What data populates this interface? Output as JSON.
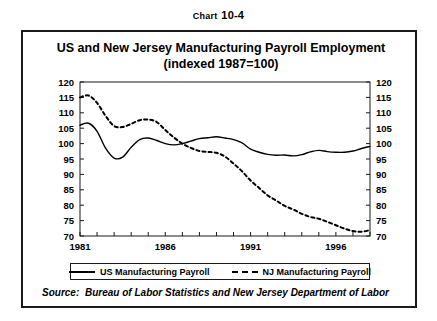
{
  "caption": {
    "prefix": "Chart",
    "number": "10-4",
    "full": "CHART 10-4"
  },
  "title": {
    "line1": "US and New Jersey Manufacturing Payroll Employment",
    "line2": "(indexed 1987=100)"
  },
  "source": {
    "label": "Source:",
    "text": "Bureau of Labor Statistics and New Jersey Department of Labor"
  },
  "legend": {
    "items": [
      {
        "label": "US Manufacturing Payroll",
        "style": "solid"
      },
      {
        "label": "NJ Manufacturing Payroll",
        "style": "dashed"
      }
    ]
  },
  "axis": {
    "y_ticks": [
      "120",
      "115",
      "110",
      "105",
      "100",
      "95",
      "90",
      "85",
      "80",
      "75",
      "70"
    ],
    "x_ticks": [
      "1981",
      "1986",
      "1991",
      "1996"
    ],
    "y_min": 70,
    "y_max": 120,
    "x_min": 1981,
    "x_max": 1998
  },
  "colors": {
    "line": "#000000",
    "frame": "#1a1a1a",
    "background": "#ffffff"
  },
  "chart_data": {
    "type": "line",
    "title": "US and New Jersey Manufacturing Payroll Employment (indexed 1987=100)",
    "xlabel": "",
    "ylabel": "Index (1987=100)",
    "xlim": [
      1981,
      1998
    ],
    "ylim": [
      70,
      120
    ],
    "yticks": [
      70,
      75,
      80,
      85,
      90,
      95,
      100,
      105,
      110,
      115,
      120
    ],
    "xticks": [
      1981,
      1986,
      1991,
      1996
    ],
    "grid": false,
    "legend_position": "bottom",
    "x": [
      1981.0,
      1981.5,
      1982.0,
      1982.5,
      1983.0,
      1983.5,
      1984.0,
      1984.5,
      1985.0,
      1985.5,
      1986.0,
      1986.5,
      1987.0,
      1987.5,
      1988.0,
      1988.5,
      1989.0,
      1989.5,
      1990.0,
      1990.5,
      1991.0,
      1991.5,
      1992.0,
      1992.5,
      1993.0,
      1993.5,
      1994.0,
      1994.5,
      1995.0,
      1995.5,
      1996.0,
      1996.5,
      1997.0,
      1997.5,
      1998.0
    ],
    "series": [
      {
        "name": "US Manufacturing Payroll",
        "style": "solid",
        "values": [
          106.0,
          106.6,
          104.0,
          98.5,
          95.3,
          95.6,
          98.8,
          101.3,
          101.8,
          101.0,
          100.0,
          99.6,
          100.0,
          100.8,
          101.6,
          101.9,
          102.2,
          101.8,
          101.3,
          100.2,
          98.2,
          97.2,
          96.5,
          96.2,
          96.3,
          96.0,
          96.4,
          97.3,
          97.8,
          97.4,
          97.2,
          97.2,
          97.6,
          98.4,
          99.1
        ]
      },
      {
        "name": "NJ Manufacturing Payroll",
        "style": "dashed",
        "values": [
          115.0,
          115.6,
          113.2,
          109.0,
          105.7,
          105.4,
          106.4,
          107.6,
          107.8,
          107.0,
          104.4,
          102.0,
          100.0,
          98.6,
          97.6,
          97.3,
          97.0,
          95.8,
          93.5,
          91.0,
          88.0,
          85.6,
          83.2,
          81.5,
          79.8,
          78.6,
          77.2,
          76.2,
          75.6,
          74.6,
          73.5,
          72.4,
          71.6,
          71.4,
          71.9
        ]
      }
    ]
  }
}
